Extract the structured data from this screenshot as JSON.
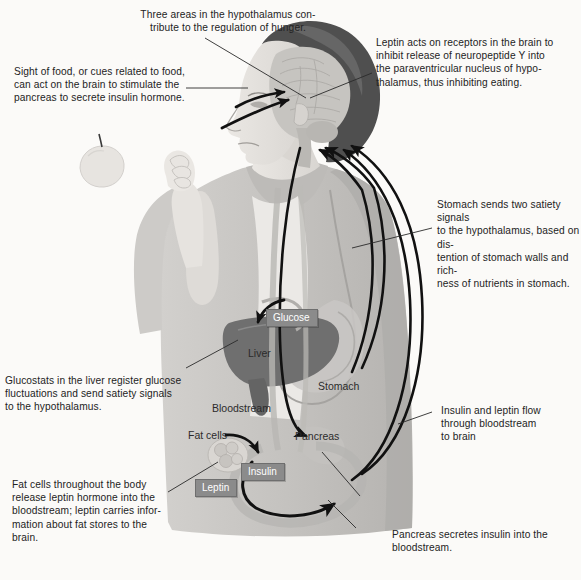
{
  "diagram": {
    "background_color": "#fbfaf8",
    "text_color": "#232323",
    "label_chip_color": "#8b8b8b",
    "hair_color": "#4f4f4f",
    "liver_color": "#6f6f6f",
    "skin_color": "#e3e0dc",
    "shirt_color": "#c9c7c4",
    "arrow_color": "#111111",
    "leader_color": "#2a2a2a"
  },
  "captions": [
    {
      "id": "hypothalamus",
      "text": "Three areas in the hypothalamus con-\ntribute to the regulation of hunger."
    },
    {
      "id": "sight-of-food",
      "text": "Sight of food, or cues related to food,\ncan act on the brain to stimulate the\npancreas to secrete insulin hormone."
    },
    {
      "id": "leptin-receptors",
      "text": "Leptin acts on receptors in the brain to\ninhibit release of neuropeptide Y into\nthe paraventricular nucleus of hypo-\nthalamus, thus inhibiting eating."
    },
    {
      "id": "stomach-satiety",
      "text": "Stomach sends two satiety signals\nto the hypothalamus, based on dis-\ntention of stomach walls and rich-\nness of nutrients in stomach."
    },
    {
      "id": "glucostats",
      "text": "Glucostats in the liver register glucose\nfluctuations and send satiety signals\nto the hypothalamus."
    },
    {
      "id": "insulin-leptin-flow",
      "text": "Insulin and leptin flow\nthrough bloodstream\nto brain"
    },
    {
      "id": "fat-cells-leptin",
      "text": "Fat cells throughout the body\nrelease leptin hormone into the\nbloodstream; leptin carries infor-\nmation about fat stores to the\nbrain."
    },
    {
      "id": "pancreas-insulin",
      "text": "Pancreas secretes insulin into the\nbloodstream."
    }
  ],
  "organ_labels": [
    {
      "id": "liver",
      "text": "Liver"
    },
    {
      "id": "stomach",
      "text": "Stomach"
    },
    {
      "id": "bloodstream",
      "text": "Bloodstream"
    },
    {
      "id": "fat-cells",
      "text": "Fat cells"
    },
    {
      "id": "pancreas",
      "text": "Pancreas"
    }
  ],
  "chip_labels": [
    {
      "id": "glucose",
      "text": "Glucose"
    },
    {
      "id": "insulin",
      "text": "Insulin"
    },
    {
      "id": "leptin",
      "text": "Leptin"
    }
  ]
}
